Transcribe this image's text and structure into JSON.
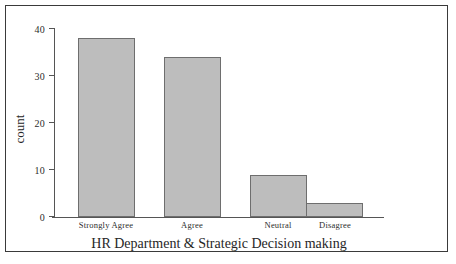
{
  "chart_data": {
    "type": "bar",
    "title": "",
    "xlabel": "HR Department & Strategic Decision making",
    "ylabel": "count",
    "categories": [
      "Strongly Agree",
      "Agree",
      "Neutral",
      "Disagree"
    ],
    "values": [
      38,
      34,
      9,
      3
    ],
    "yticks": [
      0,
      10,
      20,
      30,
      40
    ],
    "ytick_labels": [
      "0",
      "10",
      "20",
      "30",
      "40"
    ],
    "ylim": [
      0,
      42
    ],
    "grid": false,
    "legend": "none",
    "bar_fill_color": "#bdbdbd",
    "bar_edge_color": "#6e6e6e",
    "axis_color": "#555555",
    "frame_color": "#3a3a3a",
    "background_color": "#ffffff"
  }
}
